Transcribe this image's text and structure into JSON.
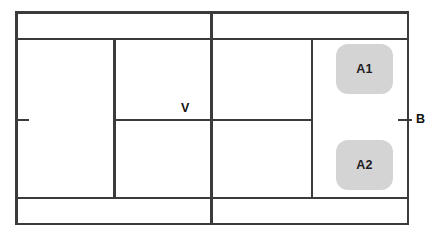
{
  "diagram": {
    "background_color": "#ffffff",
    "line_color": "#3b3b3b",
    "zone_fill_color": "#d4d4d4",
    "label_color": "#111111",
    "labels": [
      {
        "id": "v",
        "text": "V"
      },
      {
        "id": "b",
        "text": "B"
      }
    ],
    "zones": [
      {
        "id": "a1",
        "text": "A1"
      },
      {
        "id": "a2",
        "text": "A2"
      }
    ],
    "lines": [
      {
        "id": "border-top",
        "orientation": "horizontal"
      },
      {
        "id": "border-bottom",
        "orientation": "horizontal"
      },
      {
        "id": "border-left",
        "orientation": "vertical"
      },
      {
        "id": "border-right",
        "orientation": "vertical"
      },
      {
        "id": "long-service-top",
        "orientation": "horizontal"
      },
      {
        "id": "long-service-bottom",
        "orientation": "horizontal"
      },
      {
        "id": "center-service-line",
        "orientation": "horizontal"
      },
      {
        "id": "side-line-left",
        "orientation": "vertical"
      },
      {
        "id": "center-line-long",
        "orientation": "vertical"
      },
      {
        "id": "side-line-right",
        "orientation": "vertical"
      }
    ],
    "ticks": [
      {
        "id": "tick-left"
      },
      {
        "id": "tick-right"
      }
    ]
  }
}
